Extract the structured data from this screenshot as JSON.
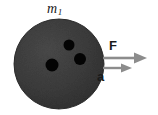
{
  "figure": {
    "kind": "free-body-diagram",
    "caption_labels": {
      "mass": "m",
      "mass_subscript": "1",
      "force": "F",
      "acceleration": "a"
    },
    "colors": {
      "ball_fill": "#3a3a3a",
      "ball_edge": "#2b2b2b",
      "hole_fill": "#000000",
      "arrow_gray": "#8c8c8c",
      "label_ink": "#1a1a1a",
      "background": "#ffffff"
    },
    "ball": {
      "center_x": 59,
      "center_y": 64,
      "radius": 45,
      "holes": [
        {
          "cx": 69,
          "cy": 45,
          "r": 5.5
        },
        {
          "cx": 80,
          "cy": 59,
          "r": 6.0
        },
        {
          "cx": 52,
          "cy": 65,
          "r": 6.5
        }
      ]
    },
    "vectors": [
      {
        "name": "force",
        "label": "F",
        "x1": 103,
        "y1": 58,
        "x2": 147,
        "y2": 58,
        "head_length": 13,
        "head_width": 11
      },
      {
        "name": "acceleration",
        "label": "a",
        "x1": 103,
        "y1": 68,
        "x2": 132,
        "y2": 68,
        "head_length": 11,
        "head_width": 9
      }
    ]
  }
}
